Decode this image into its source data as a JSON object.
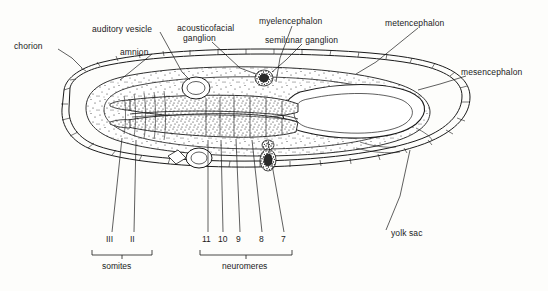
{
  "figure": {
    "type": "biological-diagram",
    "background_color": "#fdfdfb",
    "ink_color": "#1b1b1b"
  },
  "labels": {
    "chorion": "chorion",
    "amnion": "amnion",
    "auditory_vesicle": "auditory vesicle",
    "acousticofacial_ganglion_line1": "acousticofacial",
    "acousticofacial_ganglion_line2": "ganglion",
    "myelencephalon": "myelencephalon",
    "semilunar_ganglion": "semilunar ganglion",
    "metencephalon": "metencephalon",
    "mesencephalon": "mesencephalon",
    "yolk_sac": "yolk sac"
  },
  "numbers": {
    "somites": [
      "III",
      "II"
    ],
    "neuromeres": [
      "11",
      "10",
      "9",
      "8",
      "7"
    ]
  },
  "groups": {
    "somites": "somites",
    "neuromeres": "neuromeres"
  }
}
